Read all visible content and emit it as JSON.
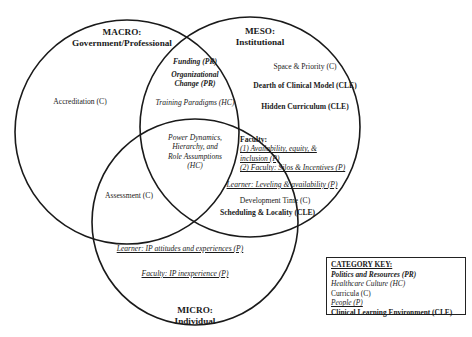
{
  "circles": {
    "macro": {
      "title": "MACRO:",
      "subtitle": "Government/Professional",
      "cx": 127,
      "cy": 132,
      "r": 112
    },
    "meso": {
      "title": "MESO:",
      "subtitle": "Institutional",
      "cx": 250,
      "cy": 127,
      "r": 110
    },
    "micro": {
      "title": "MICRO:",
      "subtitle": "Individual",
      "cx": 195,
      "cy": 222,
      "r": 103
    }
  },
  "regions": {
    "macro_only": [
      "Accreditation (C)"
    ],
    "macro_meso": {
      "funding": "Funding (PR)",
      "org_change_1": "Organizational",
      "org_change_2": "Change (PR)",
      "training": "Training Paradigms (HC)"
    },
    "meso_only": {
      "space": "Space & Priority (C)",
      "dearth": "Dearth of Clinical Model (CLE)",
      "hidden": "Hidden Curriculum (CLE)"
    },
    "center": {
      "line1": "Power Dynamics,",
      "line2": "Hierarchy, and",
      "line3": "Role Assumptions",
      "line4": "(HC)"
    },
    "meso_micro": {
      "faculty_head": "Faculty:",
      "faculty_1a": "(1) Availability, equity, &",
      "faculty_1b": "inclusion (P)",
      "faculty_2": "(2) Faculty: Silos & Incentives (P)",
      "learner": "Learner: Leveling & availability (P)",
      "dev_time": "Development Time (C)",
      "scheduling": "Scheduling & Locality (CLE)"
    },
    "macro_micro": {
      "assessment": "Assessment (C)"
    },
    "micro_only": {
      "learner_ip": "Learner: IP attitudes and experiences (P)",
      "faculty_ip": "Faculty: IP inexperience (P)"
    }
  },
  "category_key": {
    "heading": "CATEGORY KEY:",
    "items": [
      {
        "label": "Politics and Resources (PR)",
        "style": "bold-italic"
      },
      {
        "label": "Healthcare Culture (HC)",
        "style": "italic"
      },
      {
        "label": "Curricula (C)",
        "style": "plain"
      },
      {
        "label": "People (P)",
        "style": "italic-underline"
      },
      {
        "label": "Clinical Learning Environment (CLE)",
        "style": "bold"
      }
    ]
  }
}
